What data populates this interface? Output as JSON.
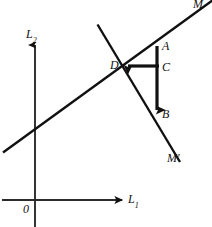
{
  "figure": {
    "background_color": "#ffffff",
    "stroke_color": "#111111",
    "width": 212,
    "height": 227,
    "axes": {
      "vertical_label": "L",
      "vertical_subscript": "2",
      "horizontal_label": "L",
      "horizontal_subscript": "1",
      "origin_label": "0"
    },
    "rays": {
      "upper_right_label": "M",
      "lower_right_label": "M",
      "lower_right_prime": "′"
    },
    "points": [
      {
        "id": "A",
        "label": "A",
        "x": 157,
        "y": 48
      },
      {
        "id": "C",
        "label": "C",
        "x": 157,
        "y": 66
      },
      {
        "id": "B",
        "label": "B",
        "x": 157,
        "y": 115
      },
      {
        "id": "D",
        "label": "D",
        "x": 122,
        "y": 66
      }
    ],
    "segments": [
      {
        "name": "rising-line",
        "from": [
          3,
          152
        ],
        "to": [
          212,
          2
        ],
        "weight": "medium"
      },
      {
        "name": "falling-line",
        "from": [
          98,
          25
        ],
        "to": [
          180,
          162
        ],
        "weight": "medium"
      },
      {
        "name": "segment-AB",
        "from": [
          157,
          46
        ],
        "to": [
          157,
          118
        ],
        "weight": "thick"
      },
      {
        "name": "segment-DC",
        "from": [
          122,
          66
        ],
        "to": [
          159,
          66
        ],
        "weight": "thick"
      },
      {
        "name": "axis-vertical",
        "from": [
          35,
          43
        ],
        "to": [
          35,
          227
        ],
        "weight": "thin"
      },
      {
        "name": "axis-horizontal",
        "from": [
          2,
          200
        ],
        "to": [
          130,
          200
        ],
        "weight": "thin"
      }
    ]
  }
}
